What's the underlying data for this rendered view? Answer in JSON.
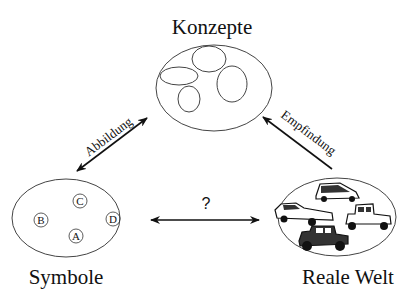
{
  "diagram": {
    "nodes": {
      "concepts": {
        "label": "Konzepte"
      },
      "symbols": {
        "label": "Symbole",
        "items": [
          "A",
          "B",
          "C",
          "D"
        ]
      },
      "real_world": {
        "label": "Reale Welt",
        "icons": [
          "car-hatchback-icon",
          "car-sedan-icon",
          "car-vintage-icon",
          "car-jeep-icon"
        ]
      }
    },
    "edges": {
      "symbols_concepts": {
        "label": "Abbildung",
        "direction": "bidirectional"
      },
      "real_world_concepts": {
        "label": "Empfindung",
        "direction": "to-concepts"
      },
      "symbols_real_world": {
        "label": "?",
        "direction": "bidirectional"
      }
    }
  }
}
